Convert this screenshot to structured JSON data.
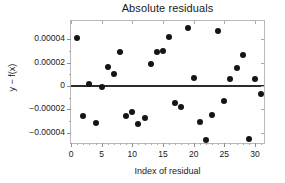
{
  "chart_data": {
    "type": "scatter",
    "title": "Absolute residuals",
    "xlabel": "Index of residual",
    "ylabel": "y − f(x)",
    "xlim": [
      0,
      31.8
    ],
    "ylim": [
      -5.05e-05,
      5.55e-05
    ],
    "grid": false,
    "legend": null,
    "x_ticks": [
      0,
      5,
      10,
      15,
      20,
      25,
      30
    ],
    "x_tick_labels": [
      "0",
      "5",
      "10",
      "15",
      "20",
      "25",
      "30"
    ],
    "y_ticks": [
      4e-05,
      2e-05,
      0,
      -2e-05,
      -4e-05
    ],
    "y_tick_labels": [
      "0.00004",
      "0.00002",
      "0",
      "−0.00002",
      "−0.00004"
    ],
    "reference_line": {
      "name": "zero-residual-line",
      "y": 0,
      "color": "#2b2b2b"
    },
    "marker": {
      "shape": "circle",
      "color": "#151515",
      "size": 6
    },
    "x": [
      1,
      2,
      3,
      4,
      5,
      6,
      7,
      8,
      9,
      10,
      11,
      12,
      13,
      14,
      15,
      16,
      17,
      18,
      19,
      20,
      21,
      22,
      23,
      24,
      25,
      26,
      27,
      28,
      29,
      30,
      31
    ],
    "y": [
      4.12e-05,
      -2.53e-05,
      1.7e-06,
      -3.18e-05,
      -5e-07,
      1.58e-05,
      1e-05,
      2.88e-05,
      -2.58e-05,
      -2.26e-05,
      -3.27e-05,
      -2.76e-05,
      1.84e-05,
      2.94e-05,
      2.99e-05,
      4.17e-05,
      -1.43e-05,
      -1.76e-05,
      4.94e-05,
      7e-06,
      -3.07e-05,
      -4.58e-05,
      -2.48e-05,
      4.72e-05,
      -1.28e-05,
      5.8e-06,
      1.49e-05,
      2.67e-05,
      -4.57e-05,
      5.7e-06,
      -7e-06
    ],
    "points": [
      {
        "index": 1,
        "value": 4.12e-05
      },
      {
        "index": 2,
        "value": -2.53e-05
      },
      {
        "index": 3,
        "value": 1.7e-06
      },
      {
        "index": 4,
        "value": -3.18e-05
      },
      {
        "index": 5,
        "value": -5e-07
      },
      {
        "index": 6,
        "value": 1.58e-05
      },
      {
        "index": 7,
        "value": 1e-05
      },
      {
        "index": 8,
        "value": 2.88e-05
      },
      {
        "index": 9,
        "value": -2.58e-05
      },
      {
        "index": 10,
        "value": -2.26e-05
      },
      {
        "index": 11,
        "value": -3.27e-05
      },
      {
        "index": 12,
        "value": -2.76e-05
      },
      {
        "index": 13,
        "value": 1.84e-05
      },
      {
        "index": 14,
        "value": 2.94e-05
      },
      {
        "index": 15,
        "value": 2.99e-05
      },
      {
        "index": 16,
        "value": 4.17e-05
      },
      {
        "index": 17,
        "value": -1.43e-05
      },
      {
        "index": 18,
        "value": -1.76e-05
      },
      {
        "index": 19,
        "value": 4.94e-05
      },
      {
        "index": 20,
        "value": 7e-06
      },
      {
        "index": 21,
        "value": -3.07e-05
      },
      {
        "index": 22,
        "value": -4.58e-05
      },
      {
        "index": 23,
        "value": -2.48e-05
      },
      {
        "index": 24,
        "value": 4.72e-05
      },
      {
        "index": 25,
        "value": -1.28e-05
      },
      {
        "index": 26,
        "value": 5.8e-06
      },
      {
        "index": 27,
        "value": 1.49e-05
      },
      {
        "index": 28,
        "value": 2.67e-05
      },
      {
        "index": 29,
        "value": -4.57e-05
      },
      {
        "index": 30,
        "value": 5.7e-06
      },
      {
        "index": 31,
        "value": -7e-06
      }
    ]
  }
}
